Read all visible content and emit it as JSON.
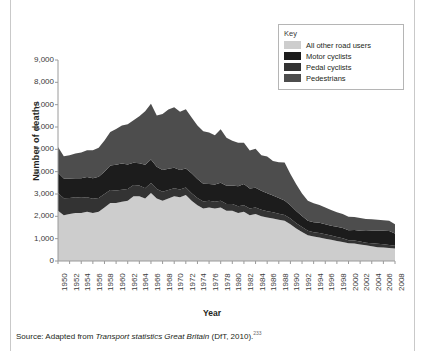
{
  "figure": {
    "source_prefix": "Source: Adapted from ",
    "source_italic": "Transport statistics Great Britain",
    "source_suffix": " (DfT, 2010).",
    "source_ref": "233"
  },
  "legend": {
    "title": "Key",
    "items": [
      {
        "label": "All other road users",
        "color": "#cdcdcd"
      },
      {
        "label": "Motor cyclists",
        "color": "#1c1c1c"
      },
      {
        "label": "Pedal cyclists",
        "color": "#333333"
      },
      {
        "label": "Pedestrians",
        "color": "#4d4d4d"
      }
    ]
  },
  "chart_data": {
    "type": "area",
    "stacked": true,
    "title": "",
    "xlabel": "Year",
    "ylabel": "Number of deaths",
    "grid": false,
    "legend_position": "top-right",
    "ylim": [
      0,
      9000
    ],
    "yticks": [
      "0",
      "1,000",
      "2,000",
      "3,000",
      "4,000",
      "5,000",
      "6,000",
      "7,000",
      "8,000",
      "9,000"
    ],
    "ytick_values": [
      0,
      1000,
      2000,
      3000,
      4000,
      5000,
      6000,
      7000,
      8000,
      9000
    ],
    "xlim": [
      1950,
      2008
    ],
    "xticks": [
      "1950",
      "1952",
      "1954",
      "1956",
      "1958",
      "1960",
      "1962",
      "1964",
      "1966",
      "1968",
      "1970",
      "1972",
      "1974",
      "1976",
      "1978",
      "1980",
      "1982",
      "1984",
      "1986",
      "1988",
      "1990",
      "1992",
      "1994",
      "1996",
      "1998",
      "2000",
      "2002",
      "2004",
      "2006",
      "2008"
    ],
    "x": [
      1950,
      1951,
      1952,
      1953,
      1954,
      1955,
      1956,
      1957,
      1958,
      1959,
      1960,
      1961,
      1962,
      1963,
      1964,
      1965,
      1966,
      1967,
      1968,
      1969,
      1970,
      1971,
      1972,
      1973,
      1974,
      1975,
      1976,
      1977,
      1978,
      1979,
      1980,
      1981,
      1982,
      1983,
      1984,
      1985,
      1986,
      1987,
      1988,
      1989,
      1990,
      1991,
      1992,
      1993,
      1994,
      1995,
      1996,
      1997,
      1998,
      1999,
      2000,
      2001,
      2002,
      2003,
      2004,
      2005,
      2006,
      2007,
      2008
    ],
    "series": [
      {
        "name": "All other road users",
        "color": "#cdcdcd",
        "stack_order": 1,
        "values": [
          2250,
          2050,
          2100,
          2150,
          2150,
          2200,
          2150,
          2200,
          2400,
          2600,
          2600,
          2650,
          2700,
          2900,
          2900,
          2800,
          3050,
          2800,
          2700,
          2800,
          2900,
          2850,
          2950,
          2700,
          2500,
          2350,
          2400,
          2350,
          2400,
          2250,
          2250,
          2150,
          2200,
          2050,
          2100,
          2000,
          1950,
          1900,
          1850,
          1800,
          1650,
          1450,
          1300,
          1150,
          1100,
          1050,
          1000,
          950,
          900,
          850,
          800,
          780,
          740,
          700,
          660,
          620,
          600,
          580,
          560
        ]
      },
      {
        "name": "Pedal cyclists",
        "color": "#333333",
        "stack_order": 2,
        "values": [
          800,
          760,
          720,
          700,
          680,
          660,
          640,
          620,
          600,
          580,
          560,
          540,
          520,
          500,
          480,
          460,
          440,
          420,
          400,
          380,
          360,
          350,
          340,
          330,
          320,
          310,
          300,
          300,
          300,
          300,
          300,
          300,
          300,
          300,
          300,
          290,
          280,
          280,
          270,
          260,
          250,
          240,
          220,
          200,
          190,
          200,
          200,
          190,
          180,
          170,
          130,
          140,
          130,
          120,
          140,
          150,
          150,
          140,
          120
        ]
      },
      {
        "name": "Motor cyclists",
        "color": "#1c1c1c",
        "stack_order": 3,
        "values": [
          900,
          880,
          870,
          860,
          880,
          900,
          920,
          950,
          1000,
          1100,
          1150,
          1180,
          1100,
          1000,
          1000,
          1050,
          1050,
          1000,
          980,
          950,
          920,
          880,
          850,
          900,
          850,
          800,
          750,
          780,
          800,
          820,
          830,
          900,
          950,
          900,
          880,
          850,
          800,
          750,
          700,
          650,
          600,
          550,
          500,
          450,
          450,
          460,
          450,
          440,
          450,
          460,
          450,
          470,
          490,
          520,
          550,
          580,
          600,
          620,
          550
        ]
      },
      {
        "name": "Pedestrians",
        "color": "#4d4d4d",
        "stack_order": 4,
        "values": [
          1150,
          1000,
          1050,
          1100,
          1150,
          1200,
          1250,
          1300,
          1400,
          1500,
          1600,
          1700,
          1800,
          1900,
          2100,
          2400,
          2500,
          2300,
          2500,
          2650,
          2700,
          2600,
          2650,
          2500,
          2400,
          2350,
          2300,
          2200,
          2400,
          2150,
          2000,
          1950,
          1850,
          1700,
          1750,
          1600,
          1650,
          1550,
          1600,
          1700,
          1400,
          1200,
          1000,
          900,
          850,
          800,
          750,
          700,
          650,
          620,
          600,
          580,
          560,
          540,
          520,
          500,
          480,
          460,
          420
        ]
      }
    ],
    "totals_note": "Stacked totals peak near 8,100 in 1965-66 and decline to about 2,100 by 2008."
  }
}
